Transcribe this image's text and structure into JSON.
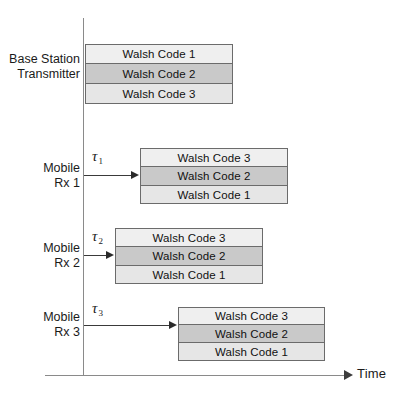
{
  "diagram": {
    "axis": {
      "time_label": "Time",
      "vertical_axis_name": "signal-origin-axis"
    },
    "colors": {
      "band_light": "#efefef",
      "band_medium": "#c9c9c9",
      "band_pale": "#e6e6e6",
      "stroke": "#6b6b6b",
      "axis": "#8a8a8a",
      "text": "#1a1a1a"
    },
    "rows": [
      {
        "id": "base-station",
        "label": "Base Station\nTransmitter",
        "has_delay_arrow": false,
        "delay_symbol": "",
        "delay_subscript": "",
        "bands": [
          {
            "text": "Walsh Code 1",
            "tone": "tone-a"
          },
          {
            "text": "Walsh Code 2",
            "tone": "tone-b"
          },
          {
            "text": "Walsh Code 3",
            "tone": "tone-c"
          }
        ]
      },
      {
        "id": "mobile-rx-1",
        "label": "Mobile\nRx 1",
        "has_delay_arrow": true,
        "delay_symbol": "τ",
        "delay_subscript": "1",
        "bands": [
          {
            "text": "Walsh Code 3",
            "tone": "tone-a"
          },
          {
            "text": "Walsh Code 2",
            "tone": "tone-b"
          },
          {
            "text": "Walsh Code 1",
            "tone": "tone-c"
          }
        ]
      },
      {
        "id": "mobile-rx-2",
        "label": "Mobile\nRx 2",
        "has_delay_arrow": true,
        "delay_symbol": "τ",
        "delay_subscript": "2",
        "bands": [
          {
            "text": "Walsh Code 3",
            "tone": "tone-a"
          },
          {
            "text": "Walsh Code 2",
            "tone": "tone-b"
          },
          {
            "text": "Walsh Code 1",
            "tone": "tone-c"
          }
        ]
      },
      {
        "id": "mobile-rx-3",
        "label": "Mobile\nRx 3",
        "has_delay_arrow": true,
        "delay_symbol": "τ",
        "delay_subscript": "3",
        "bands": [
          {
            "text": "Walsh Code 3",
            "tone": "tone-a"
          },
          {
            "text": "Walsh Code 2",
            "tone": "tone-b"
          },
          {
            "text": "Walsh Code 1",
            "tone": "tone-c"
          }
        ]
      }
    ]
  }
}
